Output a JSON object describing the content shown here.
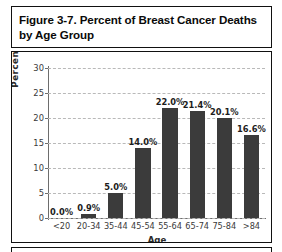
{
  "figure": {
    "title": "Figure 3-7. Percent of Breast Cancer Deaths by Age Group",
    "title_line_1": "Figure 3-7. Percent of Breast Cancer Deaths",
    "title_line_2": "by Age Group"
  },
  "chart_data": {
    "type": "bar",
    "title": "Figure 3-7. Percent of Breast Cancer Deaths by Age Group",
    "xlabel": "Age",
    "ylabel": "Percent of Deaths",
    "categories": [
      "<20",
      "20-34",
      "35-44",
      "45-54",
      "55-64",
      "65-74",
      "75-84",
      ">84"
    ],
    "values": [
      0.0,
      0.9,
      5.0,
      14.0,
      22.0,
      21.4,
      20.1,
      16.6
    ],
    "data_labels": [
      "0.0%",
      "0.9%",
      "5.0%",
      "14.0%",
      "22.0%",
      "21.4%",
      "20.1%",
      "16.6%"
    ],
    "ylim": [
      0,
      30
    ],
    "yticks": [
      0,
      5,
      10,
      15,
      20,
      25,
      30
    ],
    "ytick_labels": [
      "0",
      "5",
      "10",
      "15",
      "20",
      "25",
      "30"
    ],
    "grid": true,
    "legend": null,
    "bar_color": "#3b3b3b",
    "grid_color": "#b9b9b9",
    "axis_color": "#6d6d6d"
  }
}
